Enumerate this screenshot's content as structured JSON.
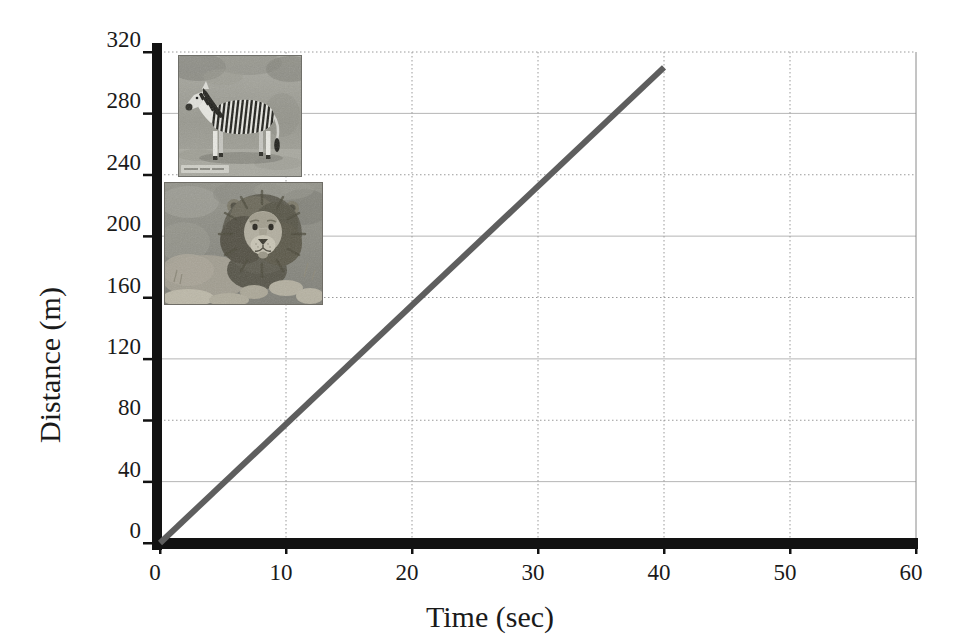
{
  "chart_data": {
    "type": "line",
    "title": "",
    "xlabel": "Time (sec)",
    "ylabel": "Distance (m)",
    "xlim": [
      0,
      60
    ],
    "ylim": [
      0,
      320
    ],
    "x_ticks": [
      0,
      10,
      20,
      30,
      40,
      50,
      60
    ],
    "y_ticks": [
      0,
      40,
      80,
      120,
      160,
      200,
      240,
      280,
      320
    ],
    "grid": "on",
    "legend": "none",
    "series": [
      {
        "name": "constant-speed-run",
        "x": [
          0,
          40
        ],
        "y": [
          0,
          310
        ],
        "color": "#5e5e5e",
        "stroke_width": 6
      }
    ]
  },
  "images": {
    "zebra": {
      "description": "grayscale photo of a zebra standing in grassland, facing left",
      "watermark": "small illegible light watermark in bottom-left corner"
    },
    "lion": {
      "description": "grayscale photo of a male lion with full mane lying in dry grass"
    }
  },
  "colors": {
    "background": "#ffffff",
    "axis_bar": "#121212",
    "grid_dotted": "#9a9a9a",
    "grid_solid": "#b5b5b5",
    "text": "#1a1a1a",
    "line": "#5e5e5e"
  }
}
